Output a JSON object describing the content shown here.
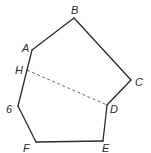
{
  "diagram": {
    "type": "polygon",
    "vertices": [
      {
        "name": "A",
        "label": "A"
      },
      {
        "name": "B",
        "label": "B"
      },
      {
        "name": "C",
        "label": "C"
      },
      {
        "name": "D",
        "label": "D"
      },
      {
        "name": "E",
        "label": "E"
      },
      {
        "name": "F",
        "label": "F"
      },
      {
        "name": "G",
        "label": "6"
      },
      {
        "name": "H",
        "label": "H"
      }
    ],
    "edges": [
      [
        "A",
        "B"
      ],
      [
        "B",
        "C"
      ],
      [
        "C",
        "D"
      ],
      [
        "D",
        "E"
      ],
      [
        "E",
        "F"
      ],
      [
        "F",
        "G"
      ],
      [
        "G",
        "H"
      ],
      [
        "H",
        "A"
      ]
    ],
    "dashed_edges": [
      [
        "H",
        "D"
      ]
    ],
    "colors": {
      "line": "#2a2a2a",
      "dashed": "#555555",
      "background": "#ffffff"
    }
  }
}
